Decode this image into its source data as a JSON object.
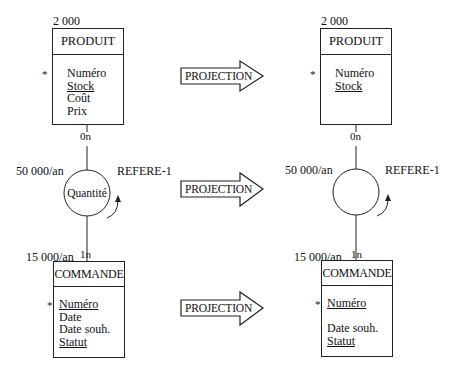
{
  "before": {
    "produit": {
      "volume": "2 000",
      "name": "PRODUIT",
      "identifier_marker": "*",
      "attributes": [
        {
          "label": "Numéro",
          "underlined": false
        },
        {
          "label": "Stock",
          "underlined": true
        },
        {
          "label": "Coût",
          "underlined": false
        },
        {
          "label": "Prix",
          "underlined": false
        }
      ]
    },
    "relation": {
      "name": "REFERE-1",
      "property": "Quantité",
      "frequency": "50 000/an",
      "card_produit": "0n",
      "card_commande": "1n"
    },
    "commande": {
      "volume": "15 000/an",
      "name": "COMMANDE",
      "identifier_marker": "*",
      "attributes": [
        {
          "label": "Numéro",
          "underlined": true
        },
        {
          "label": "Date",
          "underlined": false
        },
        {
          "label": "Date souh.",
          "underlined": false
        },
        {
          "label": "Statut",
          "underlined": true
        }
      ]
    }
  },
  "arrows": [
    {
      "label": "PROJECTION"
    },
    {
      "label": "PROJECTION"
    },
    {
      "label": "PROJECTION"
    }
  ],
  "after": {
    "produit": {
      "volume": "2 000",
      "name": "PRODUIT",
      "identifier_marker": "*",
      "attributes": [
        {
          "label": "Numéro",
          "underlined": false
        },
        {
          "label": "Stock",
          "underlined": true
        }
      ]
    },
    "relation": {
      "name": "REFERE-1",
      "property": "",
      "frequency": "50 000/an",
      "card_produit": "0n",
      "card_commande": "1n"
    },
    "commande": {
      "volume": "15 000/an",
      "name": "COMMANDE",
      "identifier_marker": "*",
      "attributes": [
        {
          "label": "Numéro",
          "underlined": true
        },
        {
          "label": "",
          "underlined": false
        },
        {
          "label": "Date souh.",
          "underlined": false
        },
        {
          "label": "Statut",
          "underlined": true
        }
      ]
    }
  }
}
